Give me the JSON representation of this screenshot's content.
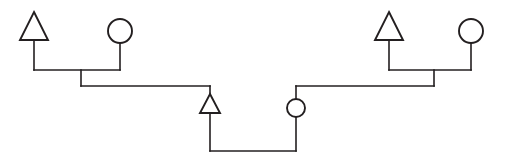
{
  "diagram": {
    "type": "pedigree",
    "background_color": "#ffffff",
    "line_color": "#231f20",
    "symbol_fill": "#ffffff",
    "line_width": 1.6,
    "symbol_line_width": 1.9,
    "canvas": {
      "width": 505,
      "height": 162
    },
    "symbols": [
      {
        "id": "gen1-left-male",
        "shape": "triangle",
        "label": "",
        "generation": 1,
        "sex": "male",
        "cx": 34,
        "cy": 26,
        "apex_x": 34,
        "apex_y": 12,
        "base_y": 40,
        "half_width": 14
      },
      {
        "id": "gen1-left-female",
        "shape": "circle",
        "label": "",
        "generation": 1,
        "sex": "female",
        "cx": 120,
        "cy": 31,
        "r": 12
      },
      {
        "id": "gen1-right-male",
        "shape": "triangle",
        "label": "",
        "generation": 1,
        "sex": "male",
        "cx": 389,
        "cy": 26,
        "apex_x": 389,
        "apex_y": 12,
        "base_y": 40,
        "half_width": 14
      },
      {
        "id": "gen1-right-female",
        "shape": "circle",
        "label": "",
        "generation": 1,
        "sex": "female",
        "cx": 471,
        "cy": 31,
        "r": 12
      },
      {
        "id": "gen2-male",
        "shape": "triangle",
        "label": "",
        "generation": 2,
        "sex": "male",
        "cx": 210,
        "cy": 103,
        "apex_x": 210,
        "apex_y": 94,
        "base_y": 113,
        "half_width": 10
      },
      {
        "id": "gen2-female",
        "shape": "circle",
        "label": "",
        "generation": 2,
        "sex": "female",
        "cx": 296,
        "cy": 108,
        "r": 9
      }
    ],
    "connectors": [
      {
        "id": "gen1-left-male-stem",
        "kind": "descent-stem",
        "points": "34,40 34,70"
      },
      {
        "id": "gen1-left-female-stem",
        "kind": "descent-stem",
        "points": "120,43 120,70"
      },
      {
        "id": "gen1-left-mating-line",
        "kind": "mating-line",
        "points": "34,70 120,70"
      },
      {
        "id": "gen1-left-sibship-drop",
        "kind": "sibship-drop",
        "points": "81,70 81,86"
      },
      {
        "id": "gen1-left-sibship-line",
        "kind": "sibship-line",
        "points": "81,86 210,86"
      },
      {
        "id": "gen2-male-drop",
        "kind": "individual-drop",
        "points": "210,86 210,94"
      },
      {
        "id": "gen1-right-male-stem",
        "kind": "descent-stem",
        "points": "389,40 389,70"
      },
      {
        "id": "gen1-right-female-stem",
        "kind": "descent-stem",
        "points": "471,43 471,70"
      },
      {
        "id": "gen1-right-mating-line",
        "kind": "mating-line",
        "points": "389,70 471,70"
      },
      {
        "id": "gen1-right-sibship-drop",
        "kind": "sibship-drop",
        "points": "434,70 434,86"
      },
      {
        "id": "gen1-right-sibship-line",
        "kind": "sibship-line",
        "points": "434,86 296,86"
      },
      {
        "id": "gen2-female-drop",
        "kind": "individual-drop",
        "points": "296,86 296,99"
      },
      {
        "id": "gen2-male-mating-stem",
        "kind": "descent-stem",
        "points": "210,113 210,151"
      },
      {
        "id": "gen2-female-mating-stem",
        "kind": "descent-stem",
        "points": "296,117 296,151"
      },
      {
        "id": "gen2-mating-line",
        "kind": "mating-line",
        "points": "210,151 296,151"
      }
    ]
  }
}
